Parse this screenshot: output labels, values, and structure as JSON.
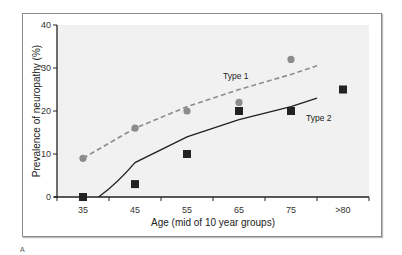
{
  "chart_data": {
    "type": "scatter",
    "title": "",
    "xlabel": "Age (mid of 10 year groups)",
    "ylabel": "Prevalence of neuropathy (%)",
    "categories": [
      "35",
      "45",
      "55",
      "65",
      "75",
      ">80"
    ],
    "yticks": [
      0,
      10,
      20,
      30,
      40
    ],
    "ylim": [
      0,
      40
    ],
    "grid": false,
    "legend": "inline labels",
    "series": [
      {
        "name": "Type 1",
        "marker": "circle",
        "color": "#8c8c8c",
        "values": [
          9,
          16,
          20,
          22,
          32,
          null
        ],
        "fit": {
          "style": "dashed",
          "color": "#8c8c8c",
          "points": [
            [
              35,
              9
            ],
            [
              45,
              16
            ],
            [
              55,
              21
            ],
            [
              65,
              25
            ],
            [
              75,
              28.5
            ],
            [
              80,
              30.5
            ]
          ]
        }
      },
      {
        "name": "Type 2",
        "marker": "square",
        "color": "#222222",
        "values": [
          0,
          3,
          10,
          20,
          20,
          25
        ],
        "fit": {
          "style": "solid",
          "color": "#222222",
          "points": [
            [
              38,
              0
            ],
            [
              45,
              8
            ],
            [
              55,
              14
            ],
            [
              65,
              18
            ],
            [
              75,
              21
            ],
            [
              80,
              23
            ]
          ]
        }
      }
    ]
  },
  "labels": {
    "type1": "Type 1",
    "type2": "Type 2",
    "x_title": "Age (mid of 10 year groups)",
    "y_title": "Prevalence of neuropathy (%)",
    "figure_mark": "A"
  }
}
